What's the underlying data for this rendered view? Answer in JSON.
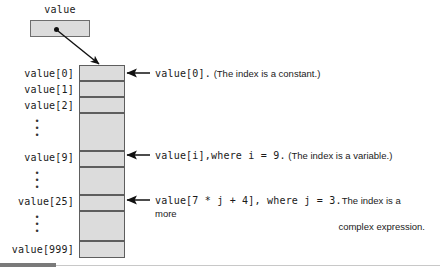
{
  "figure": {
    "caption_hidden": "",
    "pointer": {
      "label": "value",
      "name": "value-pointer-box"
    },
    "array": {
      "fill_color": "#dcdcdc",
      "border_color": "#5e5e5e",
      "labels": [
        {
          "text": "value[0]",
          "top": 68
        },
        {
          "text": "value[1]",
          "top": 84
        },
        {
          "text": "value[2]",
          "top": 100
        },
        {
          "text": "value[9]",
          "top": 152
        },
        {
          "text": "value[25]",
          "top": 196
        },
        {
          "text": "value[999]",
          "top": 244
        }
      ],
      "ellipses": [
        {
          "top": 116
        },
        {
          "top": 168
        },
        {
          "top": 212
        }
      ],
      "dot_glyph": "•"
    },
    "annotations": [
      {
        "name": "annotation-constant-index",
        "top": 65,
        "arrow_y": 73,
        "code": "value[0]",
        "code_tail": ".",
        "prose": "(The index is a constant.)",
        "line2": ""
      },
      {
        "name": "annotation-variable-index",
        "top": 147,
        "arrow_y": 155,
        "code": "value[i],where i = 9",
        "code_tail": ".",
        "prose": "(The index is a variable.)",
        "line2": ""
      },
      {
        "name": "annotation-expression-index",
        "top": 192,
        "arrow_y": 200,
        "code": "value[7 * j + 4], where j = 3",
        "code_tail": ".",
        "prose": "The index is a more",
        "line2": "complex expression."
      }
    ]
  }
}
